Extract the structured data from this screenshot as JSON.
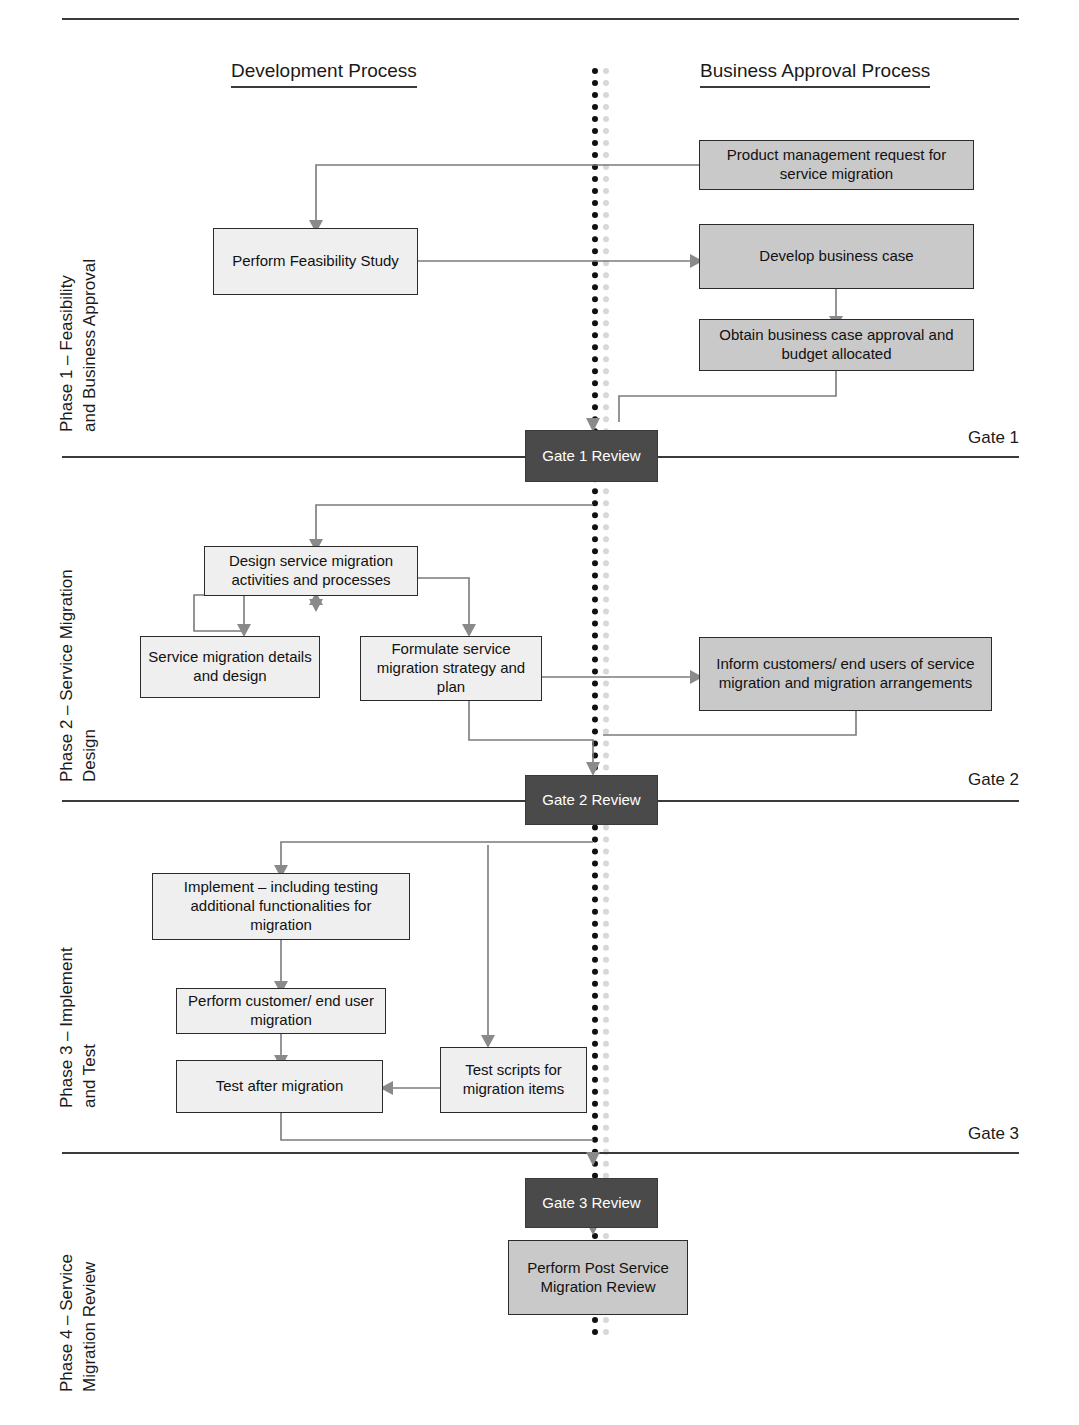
{
  "diagram": {
    "columns": [
      {
        "id": "development",
        "label": "Development Process"
      },
      {
        "id": "business",
        "label": "Business Approval Process"
      }
    ],
    "colors": {
      "light_box_fill": "#efefef",
      "shaded_box_fill": "#c9c9c9",
      "gate_box_fill": "#4a4a4a",
      "gate_box_text": "#ffffff",
      "box_border": "#2b2b2b",
      "connector": "#7b7b7b",
      "divider": "#3a3a3a"
    },
    "phases": [
      {
        "id": "phase1",
        "label": "Phase 1 – Feasibility\nand Business Approval"
      },
      {
        "id": "phase2",
        "label": "Phase 2 – Service Migration\nDesign"
      },
      {
        "id": "phase3",
        "label": "Phase 3 – Implement\nand Test"
      },
      {
        "id": "phase4",
        "label": "Phase 4 – Service\nMigration Review"
      }
    ],
    "gates": [
      {
        "id": "gate1",
        "tag": "Gate 1",
        "review_label": "Gate 1 Review"
      },
      {
        "id": "gate2",
        "tag": "Gate 2",
        "review_label": "Gate 2 Review"
      },
      {
        "id": "gate3",
        "tag": "Gate 3",
        "review_label": "Gate 3 Review"
      }
    ],
    "nodes": [
      {
        "id": "n_product_request",
        "label": "Product management request for service migration",
        "column": "business",
        "phase": "phase1",
        "style": "shaded"
      },
      {
        "id": "n_feasibility",
        "label": "Perform Feasibility Study",
        "column": "development",
        "phase": "phase1",
        "style": "light"
      },
      {
        "id": "n_business_case",
        "label": "Develop business case",
        "column": "business",
        "phase": "phase1",
        "style": "shaded"
      },
      {
        "id": "n_case_approval",
        "label": "Obtain business case approval and budget allocated",
        "column": "business",
        "phase": "phase1",
        "style": "shaded"
      },
      {
        "id": "n_design_activities",
        "label": "Design service migration activities and processes",
        "column": "development",
        "phase": "phase2",
        "style": "light"
      },
      {
        "id": "n_details_design",
        "label": "Service migration details and design",
        "column": "development",
        "phase": "phase2",
        "style": "light"
      },
      {
        "id": "n_formulate",
        "label": "Formulate service migration strategy and plan",
        "column": "development",
        "phase": "phase2",
        "style": "light"
      },
      {
        "id": "n_inform_customers",
        "label": "Inform customers/ end users of service migration and migration arrangements",
        "column": "business",
        "phase": "phase2",
        "style": "shaded"
      },
      {
        "id": "n_implement",
        "label": "Implement – including testing additional functionalities for migration",
        "column": "development",
        "phase": "phase3",
        "style": "light"
      },
      {
        "id": "n_customer_migration",
        "label": "Perform customer/ end user migration",
        "column": "development",
        "phase": "phase3",
        "style": "light"
      },
      {
        "id": "n_test_after",
        "label": "Test after migration",
        "column": "development",
        "phase": "phase3",
        "style": "light"
      },
      {
        "id": "n_test_scripts",
        "label": "Test scripts for migration items",
        "column": "development",
        "phase": "phase3",
        "style": "light"
      },
      {
        "id": "n_post_review",
        "label": "Perform Post Service Migration Review",
        "column": "business",
        "phase": "phase4",
        "style": "shaded"
      }
    ]
  }
}
